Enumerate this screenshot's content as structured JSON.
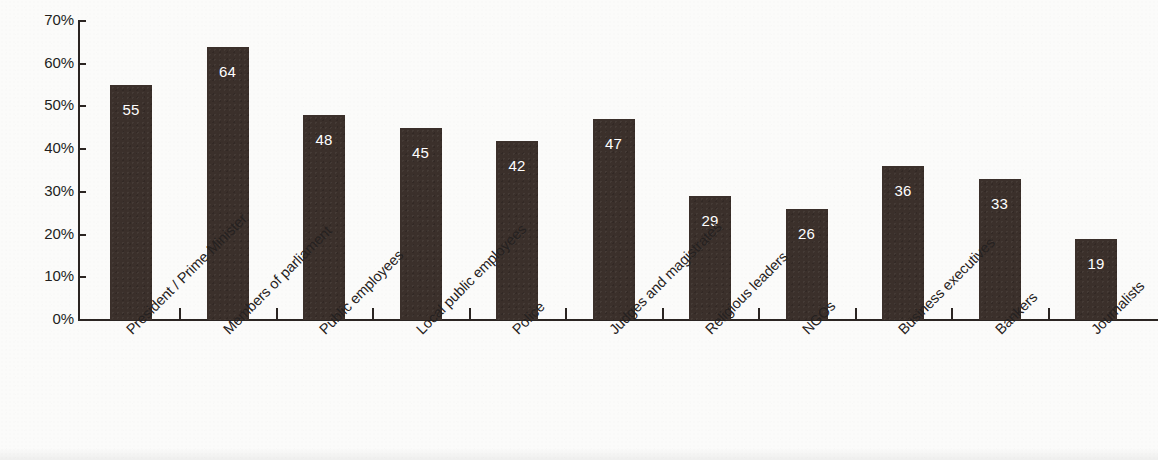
{
  "chart_data": {
    "type": "bar",
    "title": "",
    "subtitle": "",
    "xlabel": "",
    "ylabel": "",
    "ylim": [
      0,
      70
    ],
    "y_tick_labels": [
      "70%",
      "60%",
      "50%",
      "40%",
      "30%",
      "20%",
      "10%",
      "0%"
    ],
    "y_tick_values": [
      70,
      60,
      50,
      40,
      30,
      20,
      10,
      0
    ],
    "grid": false,
    "legend": "none",
    "bar_color": "#3b302b",
    "value_label_color": "#ffffff",
    "axis_color": "#2b2522",
    "background_color": "#fbfbfa",
    "categories": [
      "President / Prime Minister",
      "Members of parliament",
      "Public employees",
      "Local public employees",
      "Police",
      "Judges and magistrates",
      "Religious leaders",
      "NGOs",
      "Business executives",
      "Bankers",
      "Journalists"
    ],
    "values": [
      55,
      64,
      48,
      45,
      42,
      47,
      29,
      26,
      36,
      33,
      19
    ],
    "value_labels": [
      "55",
      "64",
      "48",
      "45",
      "42",
      "47",
      "29",
      "26",
      "36",
      "33",
      "19"
    ]
  }
}
